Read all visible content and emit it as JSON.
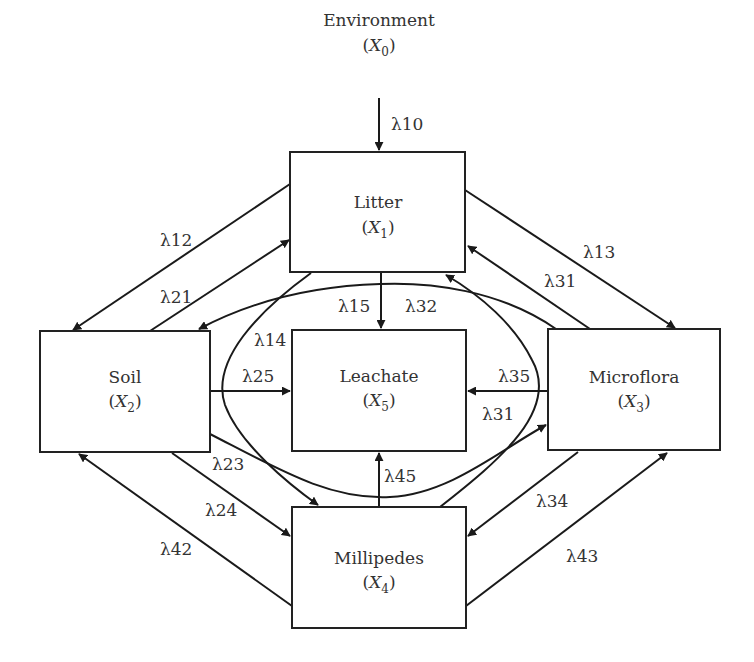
{
  "diagram": {
    "type": "compartment-flow",
    "nodes": [
      {
        "id": "X0",
        "name": "Environment",
        "var": "X",
        "sub": "0",
        "boxed": false
      },
      {
        "id": "X1",
        "name": "Litter",
        "var": "X",
        "sub": "1",
        "boxed": true
      },
      {
        "id": "X2",
        "name": "Soil",
        "var": "X",
        "sub": "2",
        "boxed": true
      },
      {
        "id": "X3",
        "name": "Microflora",
        "var": "X",
        "sub": "3",
        "boxed": true
      },
      {
        "id": "X4",
        "name": "Millipedes",
        "var": "X",
        "sub": "4",
        "boxed": true
      },
      {
        "id": "X5",
        "name": "Leachate",
        "var": "X",
        "sub": "5",
        "boxed": true
      }
    ],
    "edges": [
      {
        "id": "e10",
        "from": "X0",
        "to": "X1",
        "label": "λ10"
      },
      {
        "id": "e12",
        "from": "X1",
        "to": "X2",
        "label": "λ12"
      },
      {
        "id": "e21",
        "from": "X2",
        "to": "X1",
        "label": "λ21"
      },
      {
        "id": "e13",
        "from": "X1",
        "to": "X3",
        "label": "λ13"
      },
      {
        "id": "e31a",
        "from": "X3",
        "to": "X1",
        "label": "λ31"
      },
      {
        "id": "e15",
        "from": "X1",
        "to": "X5",
        "label": "λ15"
      },
      {
        "id": "e32",
        "from": "X3",
        "to": "X2",
        "label": "λ32"
      },
      {
        "id": "e14",
        "from": "X1",
        "to": "X4",
        "label": "λ14"
      },
      {
        "id": "e25",
        "from": "X2",
        "to": "X5",
        "label": "λ25"
      },
      {
        "id": "e35",
        "from": "X3",
        "to": "X5",
        "label": "λ35"
      },
      {
        "id": "e31b",
        "from": "X4",
        "to": "X1",
        "label": "λ31"
      },
      {
        "id": "e23",
        "from": "X2",
        "to": "X3",
        "label": "λ23"
      },
      {
        "id": "e24",
        "from": "X2",
        "to": "X4",
        "label": "λ24"
      },
      {
        "id": "e45",
        "from": "X4",
        "to": "X5",
        "label": "λ45"
      },
      {
        "id": "e34",
        "from": "X3",
        "to": "X4",
        "label": "λ34"
      },
      {
        "id": "e42",
        "from": "X4",
        "to": "X2",
        "label": "λ42"
      },
      {
        "id": "e43",
        "from": "X4",
        "to": "X3",
        "label": "λ43"
      }
    ]
  },
  "colors": {
    "stroke": "#1a1a1a",
    "text": "#333333",
    "background": "#ffffff"
  }
}
